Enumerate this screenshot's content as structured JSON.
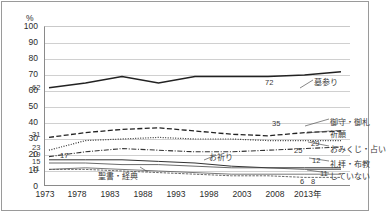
{
  "axis": {
    "y_unit": "%",
    "y_ticks": [
      "100",
      "90",
      "80",
      "70",
      "60",
      "50",
      "40",
      "30",
      "20",
      "10",
      "0"
    ],
    "x_ticks": [
      "1973",
      "1978",
      "1983",
      "1988",
      "1993",
      "1998",
      "2003",
      "2008",
      "2013年"
    ]
  },
  "series_labels": {
    "hakamairi": "墓参り",
    "omamori": "御守・御札",
    "kigan": "祈願",
    "omikuji": "おみくじ・占い",
    "oinori": "お祈り",
    "reihai": "礼拝・布教",
    "seisho": "聖書・経典",
    "shiteinai": "していない"
  },
  "value_labels": {
    "start_hakamairi": "62",
    "start_omamori": "31",
    "start_kigan": "23",
    "start_omikuji": "19",
    "start_oinori": "17",
    "start_reihai": "15",
    "start_seisho": "11",
    "end_hakamairi": "72",
    "end_omamori": "35",
    "end_kigan": "29",
    "end_omikuji": "25",
    "end_oinori": "12",
    "end_reihai": "11",
    "end_seisho": "6",
    "end_shiteinai": "8"
  },
  "chart_data": {
    "type": "line",
    "title": "",
    "xlabel": "",
    "ylabel": "%",
    "ylim": [
      0,
      100
    ],
    "grid": true,
    "legend": "right-inline-labels",
    "categories": [
      "1973",
      "1978",
      "1983",
      "1988",
      "1993",
      "1998",
      "2003",
      "2008",
      "2013"
    ],
    "series": [
      {
        "name": "墓参り",
        "values": [
          62,
          65,
          69,
          65,
          69,
          69,
          69,
          70,
          72
        ],
        "style": "solid-thick"
      },
      {
        "name": "御守・御札",
        "values": [
          31,
          34,
          36,
          37,
          35,
          33,
          32,
          34,
          35
        ],
        "style": "dashed"
      },
      {
        "name": "祈願",
        "values": [
          23,
          29,
          30,
          31,
          30,
          30,
          29,
          29,
          29
        ],
        "style": "dotted"
      },
      {
        "name": "おみくじ・占い",
        "values": [
          19,
          22,
          24,
          23,
          22,
          22,
          23,
          24,
          25
        ],
        "style": "dash-dot"
      },
      {
        "name": "お祈り",
        "values": [
          17,
          17,
          17,
          16,
          15,
          13,
          12,
          12,
          12
        ],
        "style": "solid-thin"
      },
      {
        "name": "礼拝・布教",
        "values": [
          15,
          15,
          14,
          14,
          13,
          12,
          12,
          11,
          11
        ],
        "style": "solid-thin2"
      },
      {
        "name": "聖書・経典",
        "values": [
          11,
          11,
          10,
          9,
          8,
          7,
          7,
          6,
          6
        ],
        "style": "solid-thin3"
      },
      {
        "name": "していない",
        "values": [
          11,
          12,
          11,
          10,
          9,
          8,
          8,
          8,
          8
        ],
        "style": "solid-thin4"
      }
    ]
  }
}
